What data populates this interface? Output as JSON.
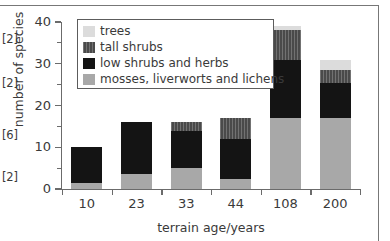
{
  "margin_refs": [
    "[2]",
    "[2]",
    "[6]",
    "[2]"
  ],
  "chart_data": {
    "type": "bar",
    "subtype": "stacked",
    "title": "",
    "xlabel": "terrain age/years",
    "ylabel": "number of species",
    "categories": [
      "10",
      "23",
      "33",
      "44",
      "108",
      "200"
    ],
    "ylim": [
      0,
      40
    ],
    "yticks": [
      0,
      10,
      20,
      30,
      40
    ],
    "ytick_labels": [
      "0",
      "10",
      "20",
      "30",
      "40"
    ],
    "yminor_ticks": [
      5,
      15,
      25,
      35
    ],
    "grid": false,
    "legend_position": "top-left-inside",
    "series": [
      {
        "name": "mosses, liverworts and lichens",
        "color": "#a8a8a8",
        "values": [
          1.5,
          3.5,
          5,
          2.5,
          17,
          17
        ]
      },
      {
        "name": "low shrubs and herbs",
        "color": "#141414",
        "values": [
          8.5,
          12.5,
          9,
          9.5,
          14,
          8.5
        ]
      },
      {
        "name": "tall shrubs",
        "color": "#4a4a4a",
        "values": [
          0,
          0,
          2,
          5,
          7,
          3
        ]
      },
      {
        "name": "trees",
        "color": "#dcdcdc",
        "values": [
          0,
          0,
          0,
          0,
          1,
          2.5
        ]
      }
    ],
    "totals": [
      10,
      16,
      16,
      17,
      39,
      31
    ],
    "legend_order": [
      "trees",
      "tall shrubs",
      "low shrubs and herbs",
      "mosses, liverworts and lichens"
    ]
  }
}
